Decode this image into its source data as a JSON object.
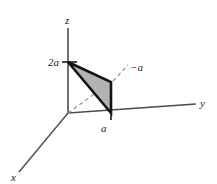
{
  "figure": {
    "type": "3d-coordinate-axes-diagram",
    "background_color": "#ffffff",
    "axes": {
      "x": {
        "label": "x",
        "label_x": 12,
        "label_y": 180
      },
      "y": {
        "label": "y",
        "label_x": 200,
        "label_y": 106
      },
      "z": {
        "label": "z",
        "label_x": 65,
        "label_y": 24
      }
    },
    "origin": {
      "x": 68,
      "y": 113
    },
    "axis_lines": {
      "z_top": {
        "x": 68,
        "y": 28
      },
      "y_right": {
        "x": 196,
        "y": 104
      },
      "x_front": {
        "x": 19,
        "y": 172
      }
    },
    "shaded_triangle": {
      "fill_color": "#b3b3b3",
      "stroke_color": "#141414",
      "vertices": [
        {
          "x": 68,
          "y": 62
        },
        {
          "x": 111,
          "y": 82
        },
        {
          "x": 111,
          "y": 113
        }
      ]
    },
    "dashed_line": {
      "from": {
        "x": 68,
        "y": 113
      },
      "to": {
        "x": 111,
        "y": 82
      },
      "color": "#808080"
    },
    "leader_line": {
      "from": {
        "x": 114,
        "y": 80
      },
      "to": {
        "x": 128,
        "y": 66
      },
      "color": "#808080"
    },
    "tick_marks": [
      {
        "name": "z-axis-tick-2a",
        "x1": 62,
        "y1": 62,
        "x2": 76,
        "y2": 62
      },
      {
        "name": "y-axis-tick-a",
        "x1": 111,
        "y1": 107,
        "x2": 111,
        "y2": 120
      }
    ],
    "labels": {
      "z_value": "2a",
      "z_value_x": 49,
      "z_value_y": 66,
      "y_value": "a",
      "y_value_x": 101,
      "y_value_y": 131,
      "negative_a": "−a",
      "negative_a_x": 131,
      "negative_a_y": 70
    }
  }
}
